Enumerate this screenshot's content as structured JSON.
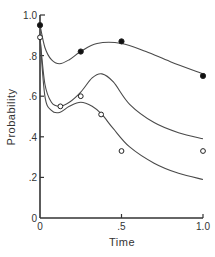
{
  "chart_data": {
    "type": "line",
    "title": "",
    "xlabel": "Time",
    "ylabel": "Probability",
    "xlim": [
      0,
      1.0
    ],
    "ylim": [
      0,
      1.0
    ],
    "grid": false,
    "legend": null,
    "x_ticks": [
      {
        "value": 0,
        "label": "0"
      },
      {
        "value": 0.5,
        "label": ".5"
      },
      {
        "value": 1.0,
        "label": "1.0"
      }
    ],
    "y_ticks": [
      {
        "value": 0,
        "label": "0"
      },
      {
        "value": 0.2,
        "label": ".2"
      },
      {
        "value": 0.4,
        "label": ".4"
      },
      {
        "value": 0.6,
        "label": ".6"
      },
      {
        "value": 0.8,
        "label": ".8"
      },
      {
        "value": 1.0,
        "label": "1.0"
      }
    ],
    "series": [
      {
        "name": "upper fitted curve",
        "kind": "curve",
        "x": [
          0,
          0.03,
          0.07,
          0.12,
          0.18,
          0.25,
          0.35,
          0.5,
          0.65,
          0.8,
          1.0
        ],
        "values": [
          0.95,
          0.84,
          0.78,
          0.76,
          0.78,
          0.82,
          0.86,
          0.86,
          0.82,
          0.77,
          0.71
        ]
      },
      {
        "name": "middle fitted curve",
        "kind": "curve",
        "x": [
          0,
          0.03,
          0.07,
          0.12,
          0.18,
          0.25,
          0.32,
          0.38,
          0.45,
          0.55,
          0.7,
          0.85,
          1.0
        ],
        "values": [
          0.89,
          0.66,
          0.57,
          0.55,
          0.57,
          0.62,
          0.69,
          0.71,
          0.67,
          0.56,
          0.47,
          0.42,
          0.39
        ]
      },
      {
        "name": "lower fitted curve",
        "kind": "curve",
        "x": [
          0,
          0.03,
          0.07,
          0.12,
          0.18,
          0.25,
          0.32,
          0.38,
          0.45,
          0.55,
          0.7,
          0.85,
          1.0
        ],
        "values": [
          0.89,
          0.6,
          0.53,
          0.52,
          0.55,
          0.57,
          0.55,
          0.51,
          0.44,
          0.35,
          0.27,
          0.22,
          0.19
        ]
      },
      {
        "name": "filled circles (observed)",
        "kind": "points",
        "marker": "filled-circle",
        "x": [
          0,
          0.25,
          0.5,
          1.0
        ],
        "values": [
          0.95,
          0.82,
          0.87,
          0.7
        ]
      },
      {
        "name": "open circles (observed)",
        "kind": "points",
        "marker": "open-circle",
        "x": [
          0,
          0.125,
          0.25,
          0.375,
          0.5,
          1.0
        ],
        "values": [
          0.89,
          0.55,
          0.6,
          0.51,
          0.33,
          0.33
        ]
      }
    ],
    "colors": {
      "line": "#4a4a4a",
      "axis": "#333333",
      "background": "#ffffff"
    }
  }
}
